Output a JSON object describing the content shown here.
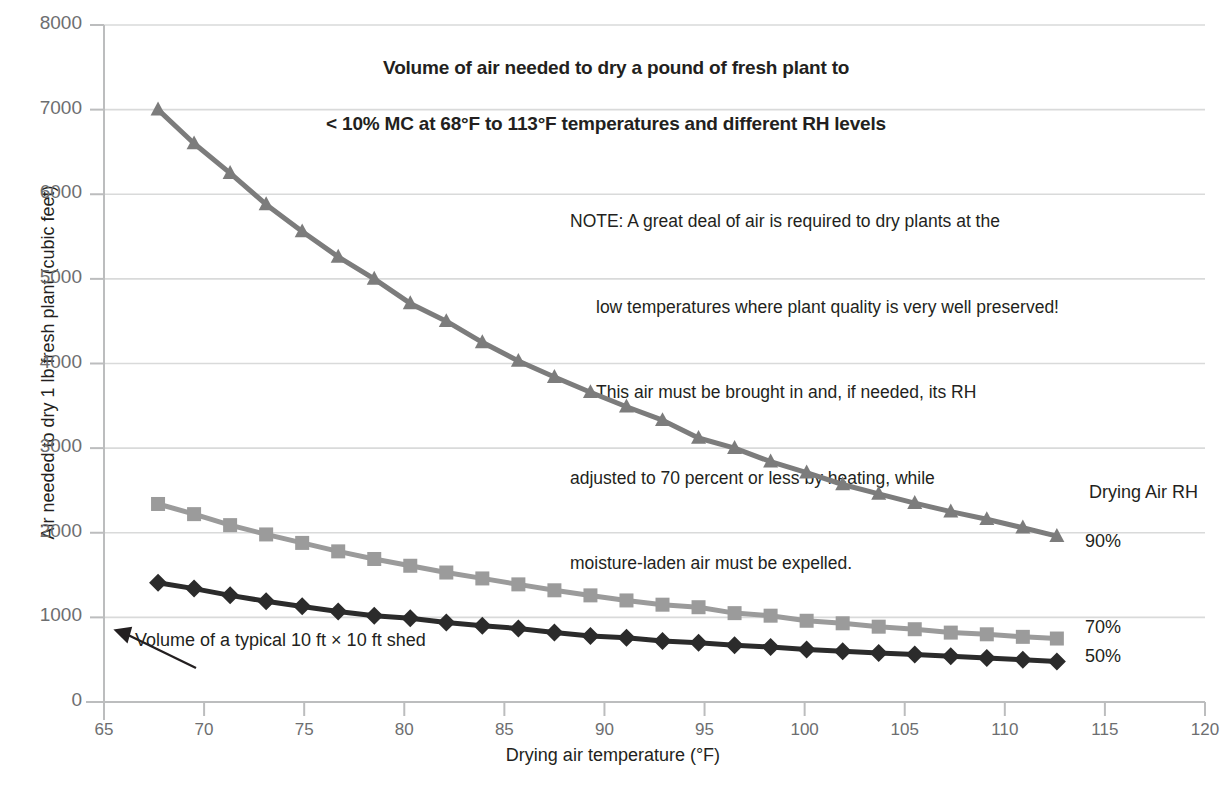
{
  "chart_data": {
    "type": "line",
    "title": "Volume of air needed to dry a pound of fresh plant to < 10% MC at 68°F to 113°F temperatures and different RH levels",
    "title_line1": "Volume of air needed to dry a pound of fresh plant to",
    "title_line2": "< 10% MC at 68°F to 113°F temperatures and different RH levels",
    "xlabel": "Drying air temperature (°F)",
    "ylabel": "Air needed to dry 1 lb fresh plant (cubic  feet)",
    "xlim": [
      65,
      120
    ],
    "ylim": [
      0,
      8000
    ],
    "xticks": [
      65,
      70,
      75,
      80,
      85,
      90,
      95,
      100,
      105,
      110,
      115,
      120
    ],
    "yticks": [
      0,
      1000,
      2000,
      3000,
      4000,
      5000,
      6000,
      7000,
      8000
    ],
    "grid": "horizontal",
    "legend_position": "right-end-of-series",
    "legend_title": "Drying Air RH",
    "x": [
      67.7,
      69.5,
      71.3,
      73.1,
      74.9,
      76.7,
      78.5,
      80.3,
      82.1,
      83.9,
      85.7,
      87.5,
      89.3,
      91.1,
      92.9,
      94.7,
      96.5,
      98.3,
      100.1,
      101.9,
      103.7,
      105.5,
      107.3,
      109.1,
      110.9,
      112.6
    ],
    "series": [
      {
        "name": "90%",
        "color": "#7c7c7c",
        "marker": "triangle",
        "values": [
          7000,
          6600,
          6250,
          5880,
          5560,
          5260,
          5000,
          4710,
          4500,
          4250,
          4030,
          3840,
          3660,
          3490,
          3330,
          3120,
          3000,
          2840,
          2710,
          2570,
          2460,
          2350,
          2250,
          2160,
          2060,
          1960
        ]
      },
      {
        "name": "70%",
        "color": "#9b9b9b",
        "marker": "square",
        "values": [
          2340,
          2220,
          2090,
          1980,
          1880,
          1780,
          1690,
          1610,
          1530,
          1460,
          1390,
          1320,
          1260,
          1200,
          1150,
          1120,
          1050,
          1020,
          960,
          930,
          890,
          860,
          820,
          800,
          770,
          750
        ]
      },
      {
        "name": "50%",
        "color": "#2b2b2b",
        "marker": "diamond",
        "values": [
          1410,
          1340,
          1260,
          1190,
          1130,
          1070,
          1020,
          990,
          940,
          900,
          870,
          820,
          780,
          760,
          720,
          700,
          670,
          650,
          620,
          600,
          580,
          560,
          540,
          520,
          500,
          480
        ]
      }
    ],
    "annotations": [
      {
        "name": "shed-volume",
        "text": "Volume of a typical 10 ft × 10 ft shed",
        "arrow": "up-left"
      },
      {
        "name": "note",
        "lines": [
          "NOTE: A great deal of air is required to dry plants at the",
          "low temperatures where plant quality is very well preserved!",
          "This air must be brought in and, if needed, its RH",
          "adjusted to 70 percent or less by heating, while",
          "moisture-laden air must be expelled."
        ]
      }
    ]
  },
  "note": {
    "line1": "NOTE: A great deal of air is required to dry plants at the",
    "line2": "low temperatures where plant quality is very well preserved!",
    "line3": "This air must be brought in and, if needed, its RH",
    "line4": "adjusted to 70 percent or less by heating, while",
    "line5": "moisture-laden air must be expelled."
  },
  "labels": {
    "legend_title": "Drying Air RH",
    "rh_90": "90%",
    "rh_70": "70%",
    "rh_50": "50%",
    "shed": "Volume of a typical 10 ft × 10 ft shed"
  },
  "colors": {
    "series_90": "#7c7c7c",
    "series_70": "#9b9b9b",
    "series_50": "#2b2b2b",
    "grid": "#d9dada",
    "axis": "#bcbdbe",
    "tick_text": "#6d6e70",
    "text": "#231f20"
  }
}
